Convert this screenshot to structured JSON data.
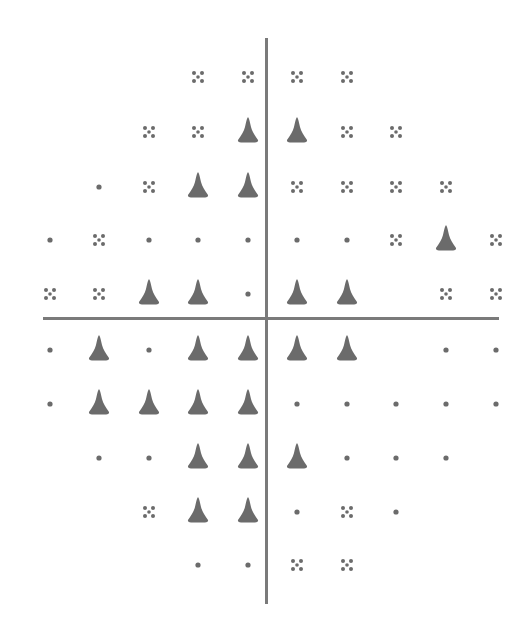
{
  "chart_data": {
    "type": "scatter",
    "title": "",
    "xlabel": "",
    "ylabel": "",
    "grid": false,
    "legend": null,
    "symbol_legend": {
      "dot": "normal / within normal limits",
      "cross": "mild depression (4-dot cross)",
      "triangle": "marked depression (solid triangle)",
      "blank": "no test point (blind spot)"
    },
    "colors": {
      "symbol": "#6b6b6b",
      "axis": "#7a7a7a",
      "background": "#ffffff"
    },
    "axes": {
      "vertical": {
        "x": 266,
        "y_from": 38,
        "y_to": 603
      },
      "horizontal": {
        "y": 318,
        "x_from": 43,
        "x_to": 498
      }
    },
    "column_x": [
      50,
      99,
      149,
      198,
      248,
      297,
      347,
      396,
      446,
      496
    ],
    "row_y": [
      77,
      132,
      187,
      240,
      294,
      350,
      404,
      458,
      512,
      565
    ],
    "rows": [
      [
        "",
        "",
        "",
        "cross",
        "cross",
        "cross",
        "cross",
        "",
        "",
        ""
      ],
      [
        "",
        "",
        "cross",
        "cross",
        "triangle",
        "triangle",
        "cross",
        "cross",
        "",
        ""
      ],
      [
        "",
        "dot",
        "cross",
        "triangle",
        "triangle",
        "cross",
        "cross",
        "cross",
        "cross",
        ""
      ],
      [
        "dot",
        "cross",
        "dot",
        "dot",
        "dot",
        "dot",
        "dot",
        "cross",
        "triangle",
        "cross"
      ],
      [
        "cross",
        "cross",
        "triangle",
        "triangle",
        "dot",
        "triangle",
        "triangle",
        "",
        "cross",
        "cross"
      ],
      [
        "dot",
        "triangle",
        "dot",
        "triangle",
        "triangle",
        "triangle",
        "triangle",
        "",
        "dot",
        "dot"
      ],
      [
        "dot",
        "triangle",
        "triangle",
        "triangle",
        "triangle",
        "dot",
        "dot",
        "dot",
        "dot",
        "dot"
      ],
      [
        "",
        "dot",
        "dot",
        "triangle",
        "triangle",
        "triangle",
        "dot",
        "dot",
        "dot",
        ""
      ],
      [
        "",
        "",
        "cross",
        "triangle",
        "triangle",
        "dot",
        "cross",
        "dot",
        "",
        ""
      ],
      [
        "",
        "",
        "",
        "dot",
        "dot",
        "cross",
        "cross",
        "",
        "",
        ""
      ]
    ],
    "counts": {
      "dot": 25,
      "cross": 23,
      "triangle": 24
    }
  }
}
